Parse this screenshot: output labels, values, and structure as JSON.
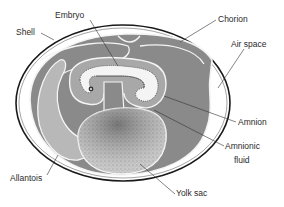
{
  "diagram": {
    "colors": {
      "background": "#ffffff",
      "shell_stroke": "#1a1a1a",
      "air_space": "#ffffff",
      "chorion_cavity": "#8a8a8a",
      "allantois": "#b8b8b8",
      "amnion_fluid": "#a8a8a8",
      "embryo": "#f2f2f2",
      "yolk": "#c4c4c4",
      "membrane": "#f4f4f4",
      "leader_line": "#333333"
    },
    "labels": {
      "embryo": "Embryo",
      "shell": "Shell",
      "chorion": "Chorion",
      "air_space": "Air space",
      "amnion": "Amnion",
      "amnionic_fluid_line1": "Amnionic",
      "amnionic_fluid_line2": "fluid",
      "allantois": "Allantois",
      "yolk_sac": "Yolk sac"
    }
  }
}
